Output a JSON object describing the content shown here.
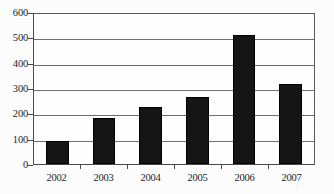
{
  "chart_data": {
    "type": "bar",
    "title": "",
    "subtitle": "",
    "xlabel": "",
    "ylabel": "",
    "categories": [
      "2002",
      "2003",
      "2004",
      "2005",
      "2006",
      "2007"
    ],
    "values": [
      90,
      182,
      224,
      263,
      508,
      316
    ],
    "series": [
      {
        "name": "",
        "values": [
          90,
          182,
          224,
          263,
          508,
          316
        ]
      }
    ],
    "ylim": [
      0,
      600
    ],
    "yticks": [
      0,
      100,
      200,
      300,
      400,
      500,
      600
    ],
    "ytick_labels": [
      "0",
      "100",
      "200",
      "300",
      "400",
      "500",
      "600"
    ],
    "grid": true,
    "grid_axis": "y",
    "legend": false,
    "legend_position": "none",
    "bar_color": "#151515",
    "plot_background": "#ffffff",
    "axis_color": "#4a4a4a",
    "annotations": []
  }
}
